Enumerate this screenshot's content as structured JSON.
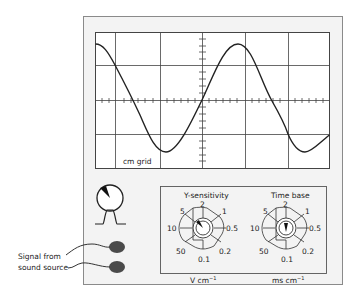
{
  "screen": {
    "grid_label": "cm grid",
    "grid_columns": 6,
    "grid_rows": 4,
    "trace": "sine wave, amplitude approx 2 cm (peak-to-peak approx 4 cm), period approx 3.6 cm"
  },
  "indicator": {
    "label": "pulse indicator"
  },
  "inputs": {
    "caption_line1": "Signal from",
    "caption_line2": "sound source"
  },
  "controls": {
    "y_sensitivity": {
      "title": "Y-sensitivity",
      "unit": "V cm",
      "unit_exp": "−1",
      "labels": [
        "5",
        "2",
        "1",
        "10",
        "0.5",
        "50",
        "0.1",
        "0.2"
      ],
      "pointer": "5"
    },
    "time_base": {
      "title": "Time base",
      "unit": "ms cm",
      "unit_exp": "−1",
      "labels": [
        "5",
        "2",
        "1",
        "10",
        "0.5",
        "50",
        "0.1",
        "0.2"
      ],
      "pointer": "2"
    }
  },
  "colors": {
    "panel_fill": "#f2f2f2",
    "panel_border": "#8a8a8a",
    "screen_fill": "#ffffff",
    "grid": "#333333",
    "trace": "#222222",
    "socket": "#4a4a4a"
  }
}
